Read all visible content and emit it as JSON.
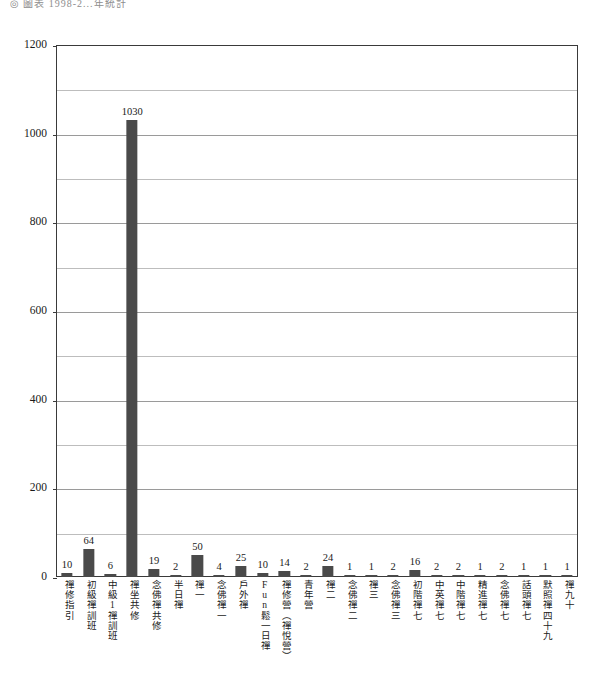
{
  "caption": {
    "text": "◎ 圖表 1998-2...年統計"
  },
  "chart_data": {
    "type": "bar",
    "title": "",
    "subtitle": "",
    "xlabel": "",
    "ylabel": "",
    "ylim": [
      0,
      1200
    ],
    "grid": true,
    "legend": "none",
    "bar_color": "#4a4a4a",
    "frame_color": "#3a3a3a",
    "gridline_color": "#9a9a9a",
    "y_ticks": [
      0,
      200,
      400,
      600,
      800,
      1000,
      1200
    ],
    "y_tick_labels": [
      "0",
      "200",
      "400",
      "600",
      "800",
      "1000",
      "1200"
    ],
    "y_minor_ticks": [
      100,
      300,
      500,
      700,
      900,
      1100
    ],
    "categories": [
      "禪修指引",
      "初級禪訓班",
      "中級1禪訓班",
      "禪坐共修",
      "念佛禪共修",
      "半日禪",
      "禪一",
      "念佛禪一",
      "戶外禪",
      "Fun鬆一日禪",
      "禪修營（禪悅營）",
      "青年營",
      "禪二",
      "念佛禪二",
      "禪三",
      "念佛禪三",
      "初階禪七",
      "中英禪七",
      "中階禪七",
      "精進禪七",
      "念佛禪七",
      "話頭禪七",
      "默照禪四十九",
      "禪九十"
    ],
    "values": [
      10,
      64,
      6,
      1030,
      19,
      2,
      50,
      4,
      25,
      10,
      14,
      2,
      24,
      1,
      1,
      2,
      16,
      2,
      2,
      1,
      2,
      1,
      1,
      1
    ],
    "value_labels": [
      "10",
      "64",
      "6",
      "1030",
      "19",
      "2",
      "50",
      "4",
      "25",
      "10",
      "14",
      "2",
      "24",
      "1",
      "1",
      "2",
      "16",
      "2",
      "2",
      "1",
      "2",
      "1",
      "1",
      "1"
    ]
  }
}
